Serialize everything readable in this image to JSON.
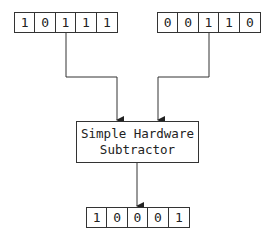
{
  "diagram": {
    "input_a": {
      "bits": [
        "1",
        "0",
        "1",
        "1",
        "1"
      ]
    },
    "input_b": {
      "bits": [
        "0",
        "0",
        "1",
        "1",
        "0"
      ]
    },
    "processor": {
      "line1": "Simple Hardware",
      "line2": "Subtractor"
    },
    "output": {
      "bits": [
        "1",
        "0",
        "0",
        "0",
        "1"
      ]
    },
    "colors": {
      "stroke": "#333333",
      "background": "#ffffff"
    }
  }
}
